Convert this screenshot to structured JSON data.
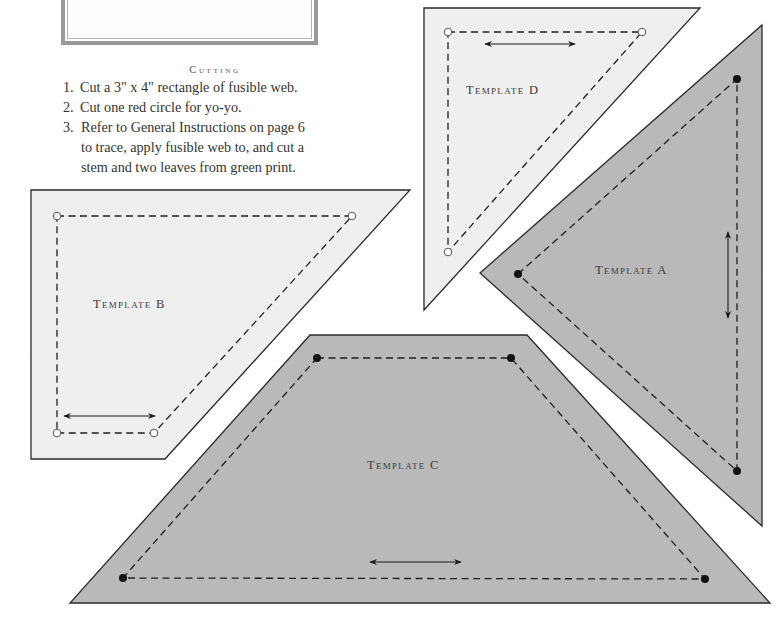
{
  "cutting": {
    "heading": "Cutting",
    "steps": [
      {
        "num": "1.",
        "lines": [
          "Cut a 3\" x 4\" rectangle of fusible web."
        ]
      },
      {
        "num": "2.",
        "lines": [
          "Cut one red circle for yo-yo."
        ]
      },
      {
        "num": "3.",
        "lines": [
          "Refer to General Instructions on page 6",
          "to trace, apply fusible web to, and cut a",
          "stem and two leaves from green print."
        ]
      }
    ]
  },
  "templates": [
    {
      "id": "D",
      "label": "Template D",
      "fill": "#efefef",
      "outline": [
        [
          424,
          8
        ],
        [
          700,
          8
        ],
        [
          424,
          310
        ]
      ],
      "seam": [
        [
          448,
          32
        ],
        [
          642,
          32
        ],
        [
          448,
          252
        ]
      ],
      "dot_style": "open",
      "grain_arrow": {
        "orientation": "horizontal",
        "from": [
          485,
          44
        ],
        "to": [
          575,
          44
        ]
      },
      "label_pos": [
        466,
        92
      ]
    },
    {
      "id": "A",
      "label": "Template A",
      "fill": "#b9b9b9",
      "outline": [
        [
          480,
          273
        ],
        [
          762,
          25
        ],
        [
          762,
          526
        ]
      ],
      "seam": [
        [
          518,
          274
        ],
        [
          737,
          79
        ],
        [
          737,
          471
        ]
      ],
      "dot_style": "filled",
      "grain_arrow": {
        "orientation": "vertical",
        "from": [
          728,
          232
        ],
        "to": [
          728,
          318
        ]
      },
      "label_pos": [
        595,
        272
      ]
    },
    {
      "id": "B",
      "label": "Template B",
      "fill": "#efefef",
      "outline": [
        [
          31,
          190
        ],
        [
          410,
          190
        ],
        [
          165,
          459
        ],
        [
          31,
          459
        ]
      ],
      "seam": [
        [
          57,
          216
        ],
        [
          352,
          216
        ],
        [
          154,
          433
        ],
        [
          57,
          433
        ]
      ],
      "dot_style": "open",
      "grain_arrow": {
        "orientation": "horizontal",
        "from": [
          64,
          416
        ],
        "to": [
          155,
          416
        ]
      },
      "label_pos": [
        93,
        306
      ]
    },
    {
      "id": "C",
      "label": "Template C",
      "fill": "#b9b9b9",
      "outline": [
        [
          310,
          335
        ],
        [
          527,
          335
        ],
        [
          770,
          603
        ],
        [
          70,
          603
        ]
      ],
      "seam": [
        [
          317,
          358
        ],
        [
          511,
          358
        ],
        [
          705,
          579
        ],
        [
          123,
          578
        ]
      ],
      "dot_style": "filled",
      "grain_arrow": {
        "orientation": "horizontal",
        "from": [
          370,
          562
        ],
        "to": [
          461,
          562
        ]
      },
      "label_pos": [
        367,
        467
      ]
    }
  ],
  "colors": {
    "light_fill": "#efefef",
    "dark_fill": "#b9b9b9",
    "outline": "#2a2a2a",
    "frame_border": "#9a9a9a"
  }
}
